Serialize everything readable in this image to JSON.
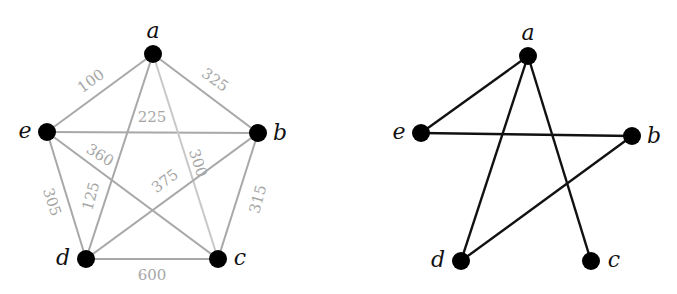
{
  "left_graph": {
    "nodes": [
      {
        "id": "a",
        "label": "a",
        "x": 153,
        "y": 54,
        "lx": 153,
        "ly": 38
      },
      {
        "id": "b",
        "label": "b",
        "x": 258,
        "y": 133,
        "lx": 280,
        "ly": 140
      },
      {
        "id": "c",
        "label": "c",
        "x": 218,
        "y": 259,
        "lx": 240,
        "ly": 265
      },
      {
        "id": "d",
        "label": "d",
        "x": 86,
        "y": 259,
        "lx": 63,
        "ly": 265
      },
      {
        "id": "e",
        "label": "e",
        "x": 47,
        "y": 132,
        "lx": 25,
        "ly": 138
      }
    ],
    "edges": [
      {
        "from": "a",
        "to": "e",
        "weight": "100",
        "wx": 91,
        "wy": 86,
        "rot": -36
      },
      {
        "from": "a",
        "to": "b",
        "weight": "325",
        "wx": 215,
        "wy": 85,
        "rot": 36
      },
      {
        "from": "e",
        "to": "b",
        "weight": "225",
        "wx": 152,
        "wy": 122,
        "rot": 0
      },
      {
        "from": "a",
        "to": "c",
        "weight": "300",
        "wx": 198,
        "wy": 168,
        "rot": 72
      },
      {
        "from": "e",
        "to": "c",
        "weight": "360",
        "wx": 100,
        "wy": 160,
        "rot": 32
      },
      {
        "from": "b",
        "to": "d",
        "weight": "375",
        "wx": 165,
        "wy": 186,
        "rot": -37
      },
      {
        "from": "e",
        "to": "d",
        "weight": "305",
        "wx": 52,
        "wy": 207,
        "rot": 72
      },
      {
        "from": "a",
        "to": "d",
        "weight": "125",
        "wx": 91,
        "wy": 201,
        "rot": -75
      },
      {
        "from": "b",
        "to": "c",
        "weight": "315",
        "wx": 258,
        "wy": 204,
        "rot": -75
      },
      {
        "from": "d",
        "to": "c",
        "weight": "600",
        "wx": 152,
        "wy": 280,
        "rot": 0
      }
    ],
    "edge_color": "#a8a8a8",
    "light_edge_color": "#c8c8c8"
  },
  "right_graph": {
    "nodes": [
      {
        "id": "a",
        "label": "a",
        "x": 528,
        "y": 56,
        "lx": 528,
        "ly": 40
      },
      {
        "id": "b",
        "label": "b",
        "x": 632,
        "y": 136,
        "lx": 654,
        "ly": 143
      },
      {
        "id": "c",
        "label": "c",
        "x": 591,
        "y": 261,
        "lx": 614,
        "ly": 267
      },
      {
        "id": "d",
        "label": "d",
        "x": 461,
        "y": 261,
        "lx": 438,
        "ly": 267
      },
      {
        "id": "e",
        "label": "e",
        "x": 421,
        "y": 133,
        "lx": 399,
        "ly": 139
      }
    ],
    "edges": [
      {
        "from": "a",
        "to": "e"
      },
      {
        "from": "a",
        "to": "d"
      },
      {
        "from": "a",
        "to": "c"
      },
      {
        "from": "e",
        "to": "b"
      },
      {
        "from": "b",
        "to": "d"
      }
    ],
    "edge_color": "#111111"
  },
  "node_color": "#000000",
  "node_radius": 9
}
